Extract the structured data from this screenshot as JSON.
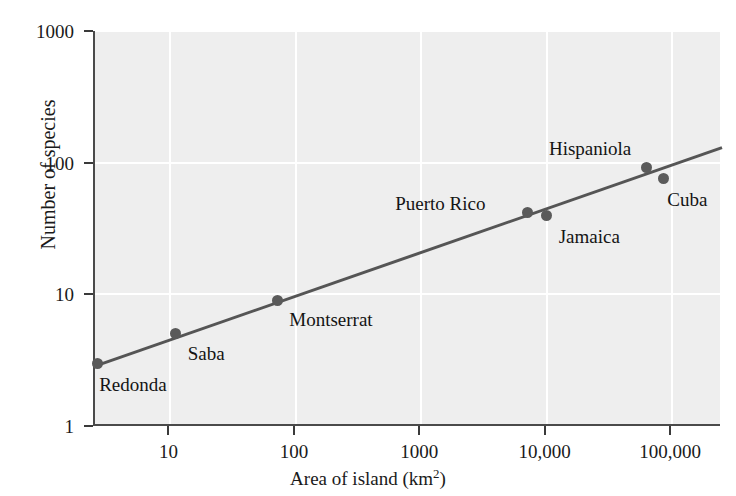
{
  "chart_data": {
    "type": "scatter",
    "title": "",
    "xlabel": "Area of island (km²)",
    "ylabel": "Number of species",
    "xscale": "log",
    "yscale": "log",
    "xlim": [
      2.5,
      250000
    ],
    "ylim": [
      1,
      1000
    ],
    "grid": true,
    "legend": false,
    "xticks": [
      {
        "value": 10,
        "label": "10"
      },
      {
        "value": 100,
        "label": "100"
      },
      {
        "value": 1000,
        "label": "1000"
      },
      {
        "value": 10000,
        "label": "10,000"
      },
      {
        "value": 100000,
        "label": "100,000"
      }
    ],
    "yticks": [
      {
        "value": 1,
        "label": "1"
      },
      {
        "value": 10,
        "label": "10"
      },
      {
        "value": 100,
        "label": "100"
      },
      {
        "value": 1000,
        "label": "1000"
      }
    ],
    "points": [
      {
        "name": "Redonda",
        "x": 2.6,
        "y": 3,
        "label_dx": 2,
        "label_dy": 12
      },
      {
        "name": "Saba",
        "x": 11,
        "y": 5,
        "label_dx": 12,
        "label_dy": 10
      },
      {
        "name": "Montserrat",
        "x": 71,
        "y": 9,
        "label_dx": 12,
        "label_dy": 10
      },
      {
        "name": "Puerto Rico",
        "x": 7000,
        "y": 42,
        "label_dx": -132,
        "label_dy": -18
      },
      {
        "name": "Jamaica",
        "x": 10000,
        "y": 40,
        "label_dx": 12,
        "label_dy": 12
      },
      {
        "name": "Hispaniola",
        "x": 63000,
        "y": 92,
        "label_dx": -98,
        "label_dy": -28
      },
      {
        "name": "Cuba",
        "x": 85000,
        "y": 76,
        "label_dx": 4,
        "label_dy": 12
      }
    ],
    "trendline": {
      "description": "species-area regression line",
      "x_start": 2.5,
      "y_start": 2.85,
      "x_end": 250000,
      "y_end": 130
    },
    "colors": {
      "plot_background": "#eeeeee",
      "gridline": "#ffffff",
      "marker": "#5a5a5a",
      "trendline": "#555555",
      "axis": "#3a3a3a",
      "text": "#141414"
    }
  }
}
